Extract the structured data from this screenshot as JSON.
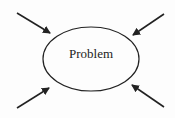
{
  "diagram": {
    "center_label": "Problem",
    "node_shape": "ellipse",
    "arrows": [
      {
        "from": "top-left",
        "to": "ellipse"
      },
      {
        "from": "top-right",
        "to": "ellipse"
      },
      {
        "from": "bottom-left",
        "to": "ellipse"
      },
      {
        "from": "bottom-right",
        "to": "ellipse"
      }
    ],
    "stroke_color": "#222222"
  }
}
